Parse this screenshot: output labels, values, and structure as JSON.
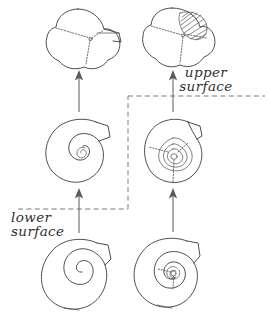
{
  "figure": {
    "background_color": "#ffffff",
    "ink_color": "#3a3a3a",
    "suture_color": "#6d6d6d",
    "arrow_color": "#5a5a5a",
    "dashed_guide_color": "#7a7a7a",
    "width": 268,
    "height": 316
  },
  "labels": {
    "upper_surface_line1": "upper",
    "upper_surface_line2": "surface",
    "lower_surface_line1": "lower",
    "lower_surface_line2": "surface"
  },
  "specimens": {
    "bottom_left": {
      "name": "planispiral-smooth-shell",
      "view": "lower surface",
      "description": "planispiral coiled test with open loose spiral and aperture notch at upper right",
      "whorl_count": 3,
      "has_hatching": false,
      "has_sutures": false
    },
    "bottom_right": {
      "name": "planispiral-multiwhorl-shell",
      "view": "upper surface",
      "description": "planispiral coiled test with many tight concentric whorls and aperture notch at upper right",
      "whorl_count": 5,
      "has_hatching": false,
      "has_sutures": false
    },
    "middle_left": {
      "name": "spiral-intermediate-lower",
      "view": "lower surface",
      "description": "rounded coiled test with small inner spiral and deep notch at upper right",
      "whorl_count": 2,
      "has_hatching": false,
      "has_sutures": false
    },
    "middle_right": {
      "name": "trochospiral-intermediate-upper",
      "view": "upper surface",
      "description": "rounded test with nested triangular inner whorls and dashed sutures radiating from centre",
      "whorl_count": 4,
      "has_hatching": false,
      "has_sutures": true
    },
    "top_left": {
      "name": "trilobed-chambered-test-lower",
      "view": "lower surface",
      "description": "three-lobed test with dotted sutures meeting at centre and flared final chamber at right",
      "chamber_count": 3,
      "has_hatching": false,
      "has_sutures": true
    },
    "top_right": {
      "name": "trilobed-chambered-test-upper",
      "view": "upper surface",
      "description": "three-lobed test with Y-shaped dotted sutures and hatched shaded final chamber at upper right",
      "chamber_count": 3,
      "has_hatching": true,
      "has_sutures": true
    }
  },
  "connectors": {
    "arrow_bottom_left_to_middle_left": "upward arrow",
    "arrow_middle_left_to_top_left": "upward arrow",
    "arrow_bottom_right_to_middle_right": "upward arrow",
    "arrow_middle_right_to_top_right": "upward arrow",
    "dashed_guide_lower": "horizontal dashed guide line at lower surface label",
    "dashed_guide_vertical": "vertical dashed guide connecting lower and upper guides",
    "dashed_guide_upper": "horizontal dashed guide line at upper surface label"
  }
}
